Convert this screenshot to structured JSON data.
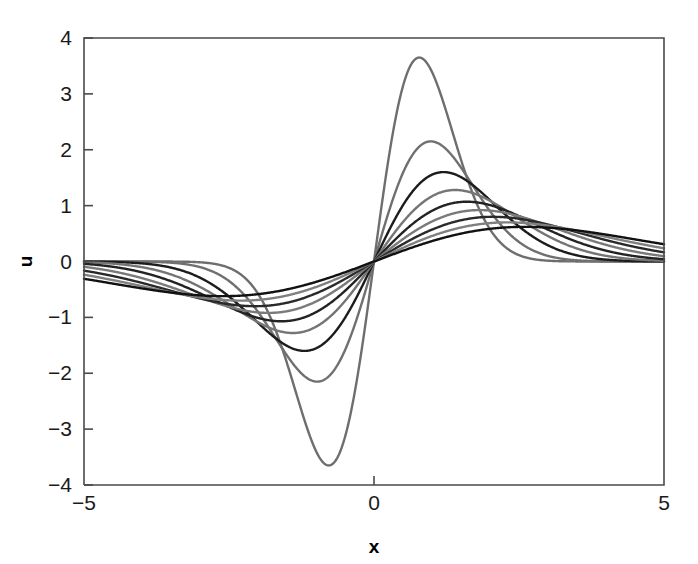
{
  "figure": {
    "background_color": "#ffffff",
    "axis_color": "#4a4a4a",
    "text_color": "#1a1a1a"
  },
  "chart_data": {
    "type": "line",
    "title": "",
    "subtitle": "",
    "xlabel": "x",
    "ylabel": "u",
    "xlim": [
      -5,
      5
    ],
    "ylim": [
      -4,
      4
    ],
    "xticks": [
      -5,
      0,
      5
    ],
    "xtick_labels": [
      "-5",
      "0",
      "5"
    ],
    "yticks": [
      -4,
      -3,
      -2,
      -1,
      0,
      1,
      2,
      3,
      4
    ],
    "ytick_labels": [
      "-4",
      "-3",
      "-2",
      "-1",
      "0",
      "1",
      "2",
      "3",
      "4"
    ],
    "grid": false,
    "legend": false,
    "legend_position": "none",
    "annotations": [],
    "series": [
      {
        "name": "curve-1",
        "color": "#6e6e6e",
        "amplitude": 3.65,
        "width": 0.62,
        "peak_x": 0.78,
        "trough_x": -0.78,
        "peak_y": 3.65,
        "trough_y": -3.65,
        "linewidth": 2.4
      },
      {
        "name": "curve-2",
        "color": "#707070",
        "amplitude": 2.15,
        "width": 0.84,
        "peak_x": 0.98,
        "trough_x": -0.98,
        "peak_y": 2.15,
        "trough_y": -2.15,
        "linewidth": 2.4
      },
      {
        "name": "curve-3",
        "color": "#1c1c1c",
        "amplitude": 1.6,
        "width": 1.04,
        "peak_x": 1.2,
        "trough_x": -1.2,
        "peak_y": 1.6,
        "trough_y": -1.6,
        "linewidth": 2.4
      },
      {
        "name": "curve-4",
        "color": "#757575",
        "amplitude": 1.28,
        "width": 1.24,
        "peak_x": 1.4,
        "trough_x": -1.4,
        "peak_y": 1.28,
        "trough_y": -1.28,
        "linewidth": 2.4
      },
      {
        "name": "curve-5",
        "color": "#232323",
        "amplitude": 1.07,
        "width": 1.44,
        "peak_x": 1.6,
        "trough_x": -1.6,
        "peak_y": 1.07,
        "trough_y": -1.07,
        "linewidth": 2.4
      },
      {
        "name": "curve-6",
        "color": "#7a7a7a",
        "amplitude": 0.92,
        "width": 1.66,
        "peak_x": 1.82,
        "trough_x": -1.82,
        "peak_y": 0.92,
        "trough_y": -0.92,
        "linewidth": 2.4
      },
      {
        "name": "curve-7",
        "color": "#2a2a2a",
        "amplitude": 0.8,
        "width": 1.9,
        "peak_x": 2.05,
        "trough_x": -2.05,
        "peak_y": 0.8,
        "trough_y": -0.8,
        "linewidth": 2.4
      },
      {
        "name": "curve-8",
        "color": "#808080",
        "amplitude": 0.7,
        "width": 2.16,
        "peak_x": 2.3,
        "trough_x": -2.3,
        "peak_y": 0.7,
        "trough_y": -0.7,
        "linewidth": 2.4
      },
      {
        "name": "curve-9",
        "color": "#111111",
        "amplitude": 0.62,
        "width": 2.45,
        "peak_x": 2.6,
        "trough_x": -2.6,
        "peak_y": 0.62,
        "trough_y": -0.62,
        "linewidth": 2.4
      }
    ]
  },
  "axes": {
    "left_px": 84,
    "top_px": 38,
    "right_px": 664,
    "bottom_px": 485
  }
}
